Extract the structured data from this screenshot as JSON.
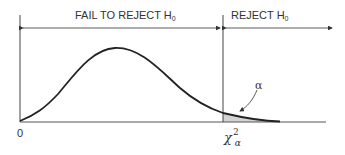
{
  "diagram": {
    "regions": {
      "fail_to_reject": {
        "label": "FAIL TO REJECT H",
        "subscript": "0"
      },
      "reject": {
        "label": "REJECT H",
        "subscript": "0"
      }
    },
    "axis": {
      "origin_label": "0"
    },
    "critical_value": {
      "symbol": "χ",
      "superscript": "2",
      "subscript": "α"
    },
    "tail_area_label": "α",
    "colors": {
      "line": "#333333",
      "shade": "#d4d4d4",
      "background": "#ffffff"
    }
  }
}
